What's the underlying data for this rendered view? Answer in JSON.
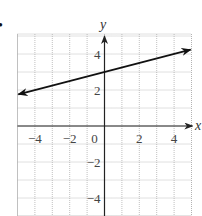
{
  "chart_data": {
    "type": "line",
    "title": "",
    "xlabel": "x",
    "ylabel": "y",
    "xlim": [
      -5,
      5
    ],
    "ylim": [
      -5.2,
      5.2
    ],
    "grid": true,
    "x_ticks": [
      -4,
      -2,
      0,
      2,
      4
    ],
    "y_ticks": [
      -4,
      -2,
      2,
      4
    ],
    "x_tick_labels": [
      "−4",
      "−2",
      "0",
      "2",
      "4"
    ],
    "y_tick_labels": [
      "−4",
      "−2",
      "2",
      "4"
    ],
    "series": [
      {
        "name": "line",
        "equation": "y = 0.25x + 3",
        "slope": 0.25,
        "intercept": 3,
        "x": [
          -5,
          5
        ],
        "y": [
          1.75,
          4.25
        ],
        "arrows": "both"
      }
    ],
    "legend": null
  },
  "colors": {
    "grid": "#b0b0b0",
    "axis": "#222222",
    "line": "#111111",
    "text": "#444444"
  },
  "marker": {
    "bullet": "•"
  }
}
